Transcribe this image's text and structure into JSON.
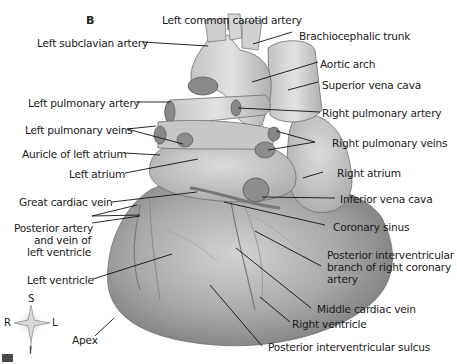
{
  "figure": {
    "panel_letter": "B",
    "corner_marker_color": "#4a4a4a",
    "heart_fill": "#bdbdbd",
    "labels": {
      "left_common_carotid_artery": "Left common carotid artery",
      "left_subclavian_artery": "Left subclavian artery",
      "brachiocephalic_trunk": "Brachiocephalic trunk",
      "aortic_arch": "Aortic arch",
      "superior_vena_cava": "Superior vena cava",
      "left_pulmonary_artery": "Left pulmonary artery",
      "right_pulmonary_artery": "Right pulmonary artery",
      "left_pulmonary_veins": "Left pulmonary veins",
      "right_pulmonary_veins": "Right pulmonary veins",
      "auricle_of_left_atrium": "Auricle of left atrium",
      "left_atrium": "Left atrium",
      "right_atrium": "Right atrium",
      "great_cardiac_vein": "Great cardiac vein",
      "inferior_vena_cava": "Inferior vena cava",
      "coronary_sinus": "Coronary sinus",
      "posterior_artery_line1": "Posterior artery",
      "posterior_artery_line2": "and vein of",
      "posterior_artery_line3": "left ventricle",
      "posterior_interventricular_branch_line1": "Posterior interventricular",
      "posterior_interventricular_branch_line2": "branch of right coronary",
      "posterior_interventricular_branch_line3": "artery",
      "left_ventricle": "Left ventricle",
      "middle_cardiac_vein": "Middle cardiac vein",
      "right_ventricle": "Right ventricle",
      "apex": "Apex",
      "posterior_interventricular_sulcus": "Posterior interventricular sulcus"
    },
    "compass": {
      "superior": "S",
      "inferior": "I",
      "right": "R",
      "left": "L"
    }
  }
}
